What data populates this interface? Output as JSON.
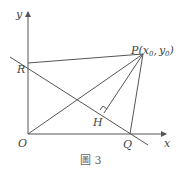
{
  "diagram": {
    "caption": "圖 3",
    "axes": {
      "x_label": "x",
      "y_label": "y",
      "origin_label": "O"
    },
    "points": {
      "P": {
        "label": "P",
        "coord_open": "(",
        "x": "x",
        "x_sub": "0",
        "sep": ",",
        "y": "y",
        "y_sub": "0",
        "coord_close": ")"
      },
      "R": {
        "label": "R"
      },
      "Q": {
        "label": "Q"
      },
      "H": {
        "label": "H"
      }
    },
    "segments": [
      "PR",
      "PO",
      "PH",
      "PQ",
      "RQ-line"
    ],
    "annotations": [
      "right-angle at H"
    ],
    "colors": {
      "line": "#555555",
      "text": "#444444",
      "background": "#ffffff"
    }
  }
}
